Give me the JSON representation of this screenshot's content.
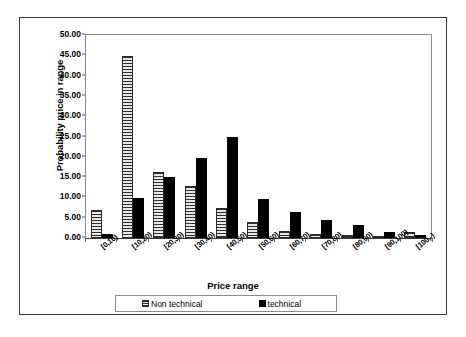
{
  "chart_data": {
    "type": "bar",
    "title": "",
    "xlabel": "Price range",
    "ylabel": "Probability price in range",
    "ylim": [
      0,
      50
    ],
    "ytick_labels": [
      "0.00",
      "5.00",
      "10.00",
      "15.00",
      "20.00",
      "25.00",
      "30.00",
      "35.00",
      "40.00",
      "45.00",
      "50.00"
    ],
    "ytick_values": [
      0,
      5,
      10,
      15,
      20,
      25,
      30,
      35,
      40,
      45,
      50
    ],
    "grid": false,
    "legend_position": "bottom",
    "categories": [
      "[0,10)",
      "[10,20)",
      "[20,30)",
      "[30,40)",
      "[40,50)",
      "[50,60)",
      "[60,70)",
      "[70,80)",
      "[80,90)",
      "[90,100)",
      "[100,-)"
    ],
    "series": [
      {
        "name": "Non technical",
        "fill": "horizontal-hatch",
        "color": "#b9b9b9",
        "values": [
          7.0,
          44.8,
          16.2,
          12.8,
          7.5,
          4.0,
          1.8,
          0.9,
          0.7,
          0.5,
          1.4
        ]
      },
      {
        "name": "technical",
        "fill": "solid",
        "color": "#000000",
        "values": [
          1.0,
          9.8,
          15.0,
          19.8,
          24.8,
          9.5,
          6.5,
          4.5,
          3.3,
          1.5,
          0.8
        ]
      }
    ]
  },
  "legend": {
    "items": [
      {
        "label": "Non technical",
        "swatch": "hatched-swatch-icon"
      },
      {
        "label": "technical",
        "swatch": "solid-black-swatch-icon"
      }
    ]
  }
}
